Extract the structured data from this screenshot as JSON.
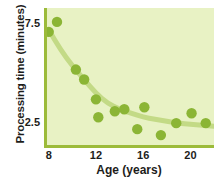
{
  "chart_data": {
    "type": "scatter",
    "title": "",
    "xlabel": "Age (years)",
    "ylabel": "Processing time (minutes)",
    "xlim": [
      7.6,
      22.0
    ],
    "ylim": [
      1.3,
      8.3
    ],
    "xticks": [
      8,
      12,
      16,
      20
    ],
    "xtick_labels": [
      "8",
      "12",
      "16",
      "20"
    ],
    "yticks": [
      7.5,
      2.5
    ],
    "ytick_labels": [
      "7.5",
      "2.5"
    ],
    "grid": false,
    "legend": null,
    "points": [
      {
        "x": 8.0,
        "y": 7.1
      },
      {
        "x": 8.7,
        "y": 7.6
      },
      {
        "x": 10.3,
        "y": 5.2
      },
      {
        "x": 11.0,
        "y": 4.7
      },
      {
        "x": 12.0,
        "y": 3.7
      },
      {
        "x": 12.2,
        "y": 2.8
      },
      {
        "x": 13.6,
        "y": 3.1
      },
      {
        "x": 14.4,
        "y": 3.2
      },
      {
        "x": 15.5,
        "y": 2.2
      },
      {
        "x": 16.1,
        "y": 3.3
      },
      {
        "x": 17.5,
        "y": 1.9
      },
      {
        "x": 18.8,
        "y": 2.5
      },
      {
        "x": 20.1,
        "y": 3.0
      },
      {
        "x": 21.3,
        "y": 2.5
      }
    ],
    "fit_curve": [
      {
        "x": 8.0,
        "y": 7.2
      },
      {
        "x": 9.0,
        "y": 6.2
      },
      {
        "x": 10.0,
        "y": 5.4
      },
      {
        "x": 11.0,
        "y": 4.7
      },
      {
        "x": 12.0,
        "y": 4.0
      },
      {
        "x": 13.0,
        "y": 3.5
      },
      {
        "x": 14.0,
        "y": 3.2
      },
      {
        "x": 15.0,
        "y": 3.0
      },
      {
        "x": 16.0,
        "y": 2.8
      },
      {
        "x": 17.0,
        "y": 2.7
      },
      {
        "x": 18.0,
        "y": 2.6
      },
      {
        "x": 19.0,
        "y": 2.5
      },
      {
        "x": 20.0,
        "y": 2.45
      },
      {
        "x": 21.0,
        "y": 2.4
      },
      {
        "x": 22.0,
        "y": 2.35
      }
    ],
    "colors": {
      "panel_background": "#e8f2c4",
      "axis_line": "#9cbb3a",
      "point_fill": "#8bb535",
      "curve": "#c3da86",
      "text": "#1d1d1b"
    },
    "marker_radius_px": 5.2,
    "curve_width_px": 5
  }
}
